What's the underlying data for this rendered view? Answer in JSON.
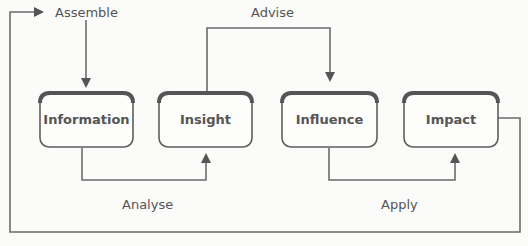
{
  "diagram": {
    "type": "process-cycle",
    "nodes": [
      {
        "id": "information",
        "label": "Information"
      },
      {
        "id": "insight",
        "label": "Insight"
      },
      {
        "id": "influence",
        "label": "Influence"
      },
      {
        "id": "impact",
        "label": "Impact"
      }
    ],
    "edges": [
      {
        "id": "assemble",
        "label": "Assemble",
        "from": "impact",
        "to": "information"
      },
      {
        "id": "analyse",
        "label": "Analyse",
        "from": "information",
        "to": "insight"
      },
      {
        "id": "advise",
        "label": "Advise",
        "from": "insight",
        "to": "influence"
      },
      {
        "id": "apply",
        "label": "Apply",
        "from": "influence",
        "to": "impact"
      }
    ],
    "colors": {
      "line": "#6b6b6b",
      "text": "#555555",
      "box_fill": "#fdfdfc",
      "background": "#fbfbfa"
    }
  }
}
